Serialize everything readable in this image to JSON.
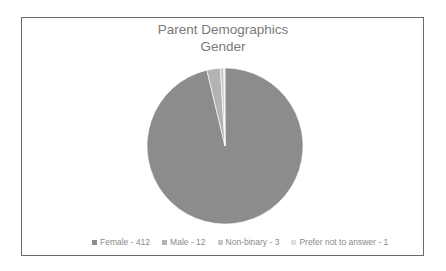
{
  "chart_data": {
    "type": "pie",
    "title": "Parent Demographics",
    "subtitle": "Gender",
    "categories": [
      "Female",
      "Male",
      "Non-binary",
      "Prefer not to answer"
    ],
    "values": [
      412,
      12,
      3,
      1
    ],
    "colors": [
      "#8c8c8c",
      "#b3b3b3",
      "#c8c8c8",
      "#dedede"
    ],
    "legend_position": "bottom",
    "legend_labels": [
      "Female - 412",
      "Male - 12",
      "Non-binary - 3",
      "Prefer not to answer - 1"
    ]
  }
}
